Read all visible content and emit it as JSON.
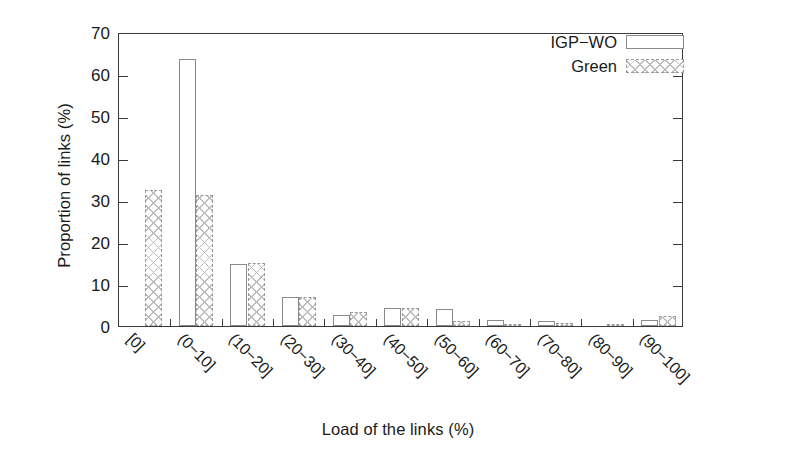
{
  "chart_data": {
    "type": "bar",
    "title": "",
    "xlabel": "Load of the links (%)",
    "ylabel": "Proportion of links (%)",
    "categories": [
      "[0]",
      "(0−10]",
      "(10−20]",
      "(20−30]",
      "(30−40]",
      "(40−50]",
      "(50−60]",
      "(60−70]",
      "(70−80]",
      "(80−90]",
      "(90−100]"
    ],
    "series": [
      {
        "name": "IGP−WO",
        "fill": "white",
        "values": [
          0,
          63.5,
          14.8,
          7.0,
          2.7,
          4.2,
          4.0,
          1.5,
          1.3,
          0,
          1.5
        ]
      },
      {
        "name": "Green",
        "fill": "cross-hatch",
        "values": [
          32.5,
          31.2,
          14.9,
          6.9,
          3.4,
          4.2,
          1.2,
          0.5,
          0.6,
          0.5,
          2.3
        ]
      }
    ],
    "ylim": [
      0,
      70
    ],
    "yticks": [
      "0",
      "10",
      "20",
      "30",
      "40",
      "50",
      "60",
      "70"
    ],
    "grid": false,
    "legend_position": "top-right"
  },
  "legend": {
    "entries": [
      {
        "label": "IGP−WO"
      },
      {
        "label": "Green"
      }
    ]
  }
}
